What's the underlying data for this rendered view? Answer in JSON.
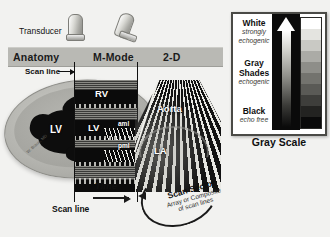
{
  "figure": {
    "background_color": "#f2f2f0"
  },
  "transducer": {
    "label": "Transducer",
    "probes": [
      "m-mode-probe",
      "two-d-probe"
    ]
  },
  "header": {
    "panels": [
      {
        "label": "Anatomy"
      },
      {
        "label": "M-Mode"
      },
      {
        "label": "2-D"
      }
    ],
    "band_color": "#b9b9b4"
  },
  "anatomy_panel": {
    "scan_line_label": "Scan line",
    "scan_line_arrow": "arrow-right",
    "chamber_labels": [
      "LV"
    ],
    "credit": "W. Braun, MD"
  },
  "mmode_panel": {
    "chamber_labels": [
      "RV",
      "LV"
    ],
    "leaflet_labels": [
      "aml",
      "pml"
    ],
    "time_label": "Time",
    "time_arrow": "arrow-right",
    "scan_line_label": "Scan line"
  },
  "twod_panel": {
    "chamber_labels": [
      "Aorta",
      "LA"
    ],
    "sector_title": "Scan Sector",
    "sector_sub_line1": "Array or Composite",
    "sector_sub_line2": "of scan lines",
    "sector_arrow": "arc-double-arrow"
  },
  "grayscale_panel": {
    "caption": "Gray Scale",
    "levels": [
      {
        "name": "White",
        "description": "strongly echogenic"
      },
      {
        "name": "Gray Shades",
        "name_line1": "Gray",
        "name_line2": "Shades",
        "description": "echogenic"
      },
      {
        "name": "Black",
        "description": "echo free"
      }
    ],
    "arrow": "up-arrow-gradient",
    "step_colors": [
      "#ffffff",
      "#e4e4e0",
      "#c9c9c4",
      "#ababa6",
      "#8e8e89",
      "#73736e",
      "#5a5a56",
      "#3e3e3b",
      "#232321",
      "#0a0a0a"
    ],
    "border_color": "#4a4a46"
  }
}
